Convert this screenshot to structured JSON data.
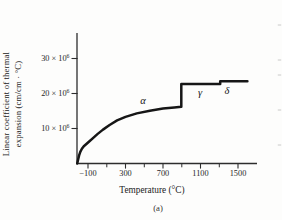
{
  "figure": {
    "caption": "(a)",
    "colors": {
      "ink": "#161616",
      "axis": "#2d2d2d",
      "text": "#262626",
      "paper": "#fdfdfc",
      "faint": "#c4c4c4"
    },
    "adjacent_figure_tick_y": [
      25,
      60,
      75,
      110,
      145
    ]
  },
  "chart_data": {
    "type": "line",
    "title": "",
    "xlabel": "Temperature (°C)",
    "ylabel": "Linear coefficient of thermal expansion (cm/cm · °C)",
    "ylabel_lines": [
      "Linear coefficient of thermal",
      "expansion (cm/cm · °C)"
    ],
    "xlim": [
      -250,
      1700
    ],
    "ylim": [
      0,
      37
    ],
    "grid": false,
    "legend": null,
    "x_major_ticks": [
      {
        "value": -100,
        "label": "−100"
      },
      {
        "value": 300,
        "label": "300"
      },
      {
        "value": 700,
        "label": "700"
      },
      {
        "value": 1100,
        "label": "1100"
      },
      {
        "value": 1500,
        "label": "1500"
      }
    ],
    "x_minor_ticks": [
      100,
      500,
      900,
      1300
    ],
    "y_ticks": [
      {
        "value": 30,
        "label_base": "30 × 10",
        "label_exp": "6"
      },
      {
        "value": 20,
        "label_base": "20 × 10",
        "label_exp": "6"
      },
      {
        "value": 10,
        "label_base": "10 × 10",
        "label_exp": "6"
      }
    ],
    "series": [
      {
        "name": "alpha-phase",
        "points": [
          [
            -215,
            0
          ],
          [
            -205,
            1.2
          ],
          [
            -195,
            2.3
          ],
          [
            -182,
            3.3
          ],
          [
            -165,
            4.2
          ],
          [
            -145,
            4.9
          ],
          [
            -120,
            5.5
          ],
          [
            -90,
            6.2
          ],
          [
            -50,
            7.2
          ],
          [
            0,
            8.4
          ],
          [
            60,
            9.7
          ],
          [
            130,
            11.0
          ],
          [
            210,
            12.3
          ],
          [
            300,
            13.3
          ],
          [
            420,
            14.3
          ],
          [
            560,
            15.1
          ],
          [
            700,
            15.7
          ],
          [
            820,
            16.0
          ],
          [
            895,
            16.2
          ]
        ]
      },
      {
        "name": "alpha-to-gamma-jump",
        "points": [
          [
            895,
            16.2
          ],
          [
            895,
            22.7
          ]
        ]
      },
      {
        "name": "gamma-phase",
        "points": [
          [
            895,
            22.7
          ],
          [
            1310,
            22.7
          ]
        ]
      },
      {
        "name": "gamma-to-delta-step",
        "points": [
          [
            1310,
            22.7
          ],
          [
            1310,
            23.5
          ]
        ]
      },
      {
        "name": "delta-phase",
        "points": [
          [
            1310,
            23.5
          ],
          [
            1600,
            23.5
          ]
        ]
      }
    ],
    "annotations": [
      {
        "name": "alpha",
        "text": "α",
        "x": 487,
        "y": 17.1
      },
      {
        "name": "gamma",
        "text": "γ",
        "x": 1095,
        "y": 19.3
      },
      {
        "name": "delta",
        "text": "δ",
        "x": 1383,
        "y": 19.8
      }
    ]
  }
}
